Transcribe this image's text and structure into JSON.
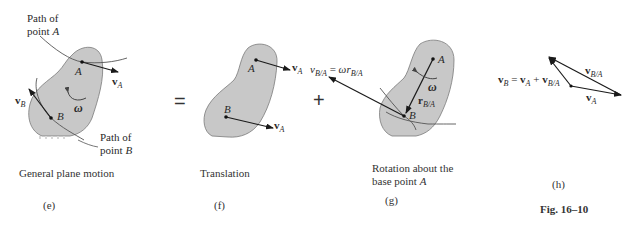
{
  "figure": {
    "number_label": "Fig. 16–10",
    "fill_color": "#c8c8c8",
    "stroke_color": "#6e6e6e",
    "line_color": "#222222"
  },
  "panels": {
    "e": {
      "tag": "(e)",
      "caption": "General plane motion",
      "path_a_label_line1": "Path of",
      "path_a_label_line2": "point ",
      "path_a_point": "A",
      "path_b_label_line1": "Path of",
      "path_b_label_line2": "point ",
      "path_b_point": "B",
      "point_a": "A",
      "point_b": "B",
      "velocity_a": "v",
      "velocity_a_sub": "A",
      "velocity_b": "v",
      "velocity_b_sub": "B",
      "omega": "ω"
    },
    "operator_equals": "=",
    "f": {
      "tag": "(f)",
      "caption": "Translation",
      "point_a": "A",
      "point_b": "B",
      "velocity_at_a": "v",
      "velocity_at_a_sub": "A",
      "velocity_at_b": "v",
      "velocity_at_b_sub": "A"
    },
    "operator_plus": "+",
    "g": {
      "tag": "(g)",
      "caption_line1": "Rotation about the",
      "caption_line2": "base point ",
      "caption_point": "A",
      "point_a": "A",
      "point_b": "B",
      "omega": "ω",
      "r_label": "r",
      "r_sub": "B/A",
      "relative_velocity_lhs": "v",
      "relative_velocity_lhs_sub": "B/A",
      "relative_velocity_eq": " = ",
      "relative_velocity_rhs": "ωr",
      "relative_velocity_rhs_sub": "B/A"
    },
    "h": {
      "tag": "(h)",
      "equation_vb": "v",
      "equation_vb_sub": "B",
      "equation_eq": " = ",
      "equation_va": "v",
      "equation_va_sub": "A",
      "equation_plus": " + ",
      "equation_vba": "v",
      "equation_vba_sub": "B/A",
      "label_vba": "v",
      "label_vba_sub": "B/A",
      "label_va": "v",
      "label_va_sub": "A"
    }
  }
}
